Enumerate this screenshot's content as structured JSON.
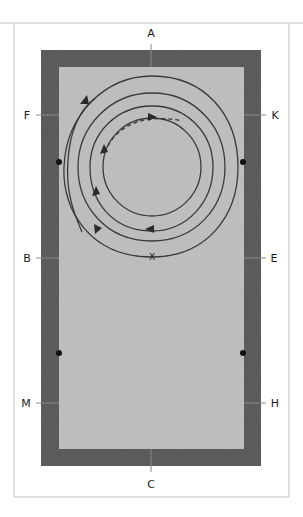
{
  "diagram": {
    "colors": {
      "frame": "#d4d4d4",
      "arena_border": "#5e5e5e",
      "arena_surface": "#bcbcbc",
      "line": "#3a3a3a"
    },
    "letters": {
      "top": "A",
      "bottom": "C",
      "left_upper": "F",
      "left_middle": "B",
      "left_lower": "M",
      "right_upper": "K",
      "right_middle": "E",
      "right_lower": "H"
    },
    "center_marker": "X"
  }
}
